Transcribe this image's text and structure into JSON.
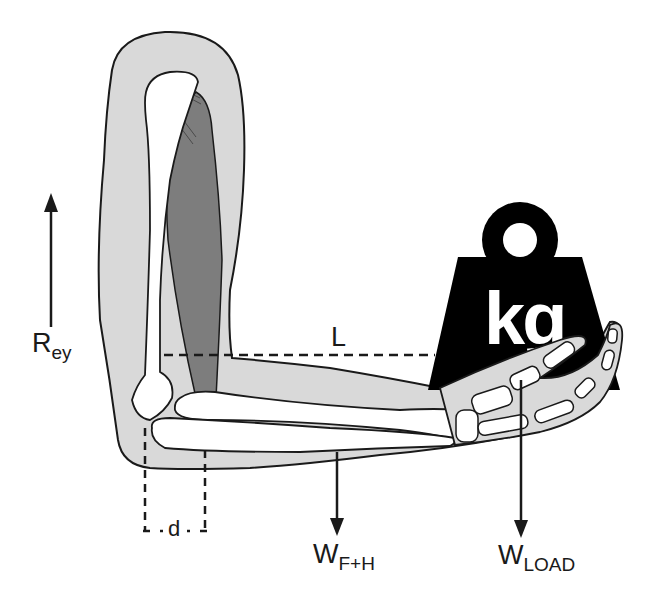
{
  "diagram": {
    "type": "free-body diagram of the forearm (lever system)",
    "labels": {
      "reaction_force": {
        "main": "R",
        "sub": "ey"
      },
      "lever_arm_load": "L",
      "muscle_moment_arm": "d",
      "forearm_hand_weight": {
        "main": "W",
        "sub": "F+H"
      },
      "load_weight": {
        "main": "W",
        "sub": "LOAD"
      },
      "weight_mark": "kg"
    },
    "colors": {
      "skin": "#d9d9d9",
      "muscle": "#7d7d7d",
      "bone": "#ffffff",
      "outline": "#1a1a1a",
      "weight": "#000000",
      "background": "#ffffff"
    }
  }
}
